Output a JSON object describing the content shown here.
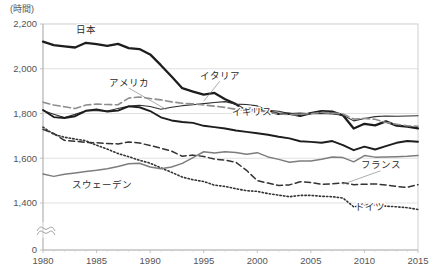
{
  "chart_data": {
    "type": "line",
    "title": "",
    "subtitle": "",
    "unit_label": "(時間)",
    "xlabel": "",
    "ylabel": "",
    "xlim": [
      1980,
      2015
    ],
    "ylim": [
      1300,
      2200
    ],
    "ytick_values": [
      2200,
      2000,
      1800,
      1600,
      1400,
      0
    ],
    "ytick_labels": [
      "2,200",
      "2,000",
      "1,800",
      "1,600",
      "1,400",
      "0"
    ],
    "xtick_values": [
      1980,
      1985,
      1990,
      1995,
      2000,
      2005,
      2010,
      2015
    ],
    "xtick_labels": [
      "1980",
      "1985",
      "1990",
      "1995",
      "2000",
      "2005",
      "2010",
      "2015"
    ],
    "grid": true,
    "grid_axis": "y",
    "axis_break": true,
    "legend_position": "inline-annotations",
    "x": [
      1980,
      1981,
      1982,
      1983,
      1984,
      1985,
      1986,
      1987,
      1988,
      1989,
      1990,
      1991,
      1992,
      1993,
      1994,
      1995,
      1996,
      1997,
      1998,
      1999,
      2000,
      2001,
      2002,
      2003,
      2004,
      2005,
      2006,
      2007,
      2008,
      2009,
      2010,
      2011,
      2012,
      2013,
      2014,
      2015
    ],
    "series": [
      {
        "name": "日本",
        "label": "日本",
        "label_en": "Japan",
        "style": "solid-thick",
        "color": "#1d1d1d",
        "width": 2.3,
        "label_x": 1984.0,
        "label_y": 2158,
        "leader": false,
        "values": [
          2121,
          2106,
          2100,
          2095,
          2116,
          2110,
          2102,
          2111,
          2092,
          2088,
          2064,
          2016,
          1965,
          1913,
          1898,
          1884,
          1892,
          1864,
          1842,
          1810,
          1821,
          1809,
          1798,
          1799,
          1789,
          1802,
          1811,
          1808,
          1792,
          1733,
          1754,
          1747,
          1765,
          1746,
          1741,
          1734
        ]
      },
      {
        "name": "アメリカ",
        "label": "アメリカ",
        "label_en": "United States",
        "style": "solid-thin",
        "color": "#2e2e2e",
        "width": 1.1,
        "label_x": 1988.0,
        "label_y": 1925,
        "leader": true,
        "leader_to_x": 1991.5,
        "leader_to_y": 1818,
        "values": [
          1813,
          1797,
          1782,
          1796,
          1812,
          1812,
          1811,
          1822,
          1833,
          1837,
          1831,
          1819,
          1828,
          1835,
          1839,
          1844,
          1849,
          1853,
          1842,
          1840,
          1834,
          1814,
          1810,
          1800,
          1802,
          1799,
          1800,
          1798,
          1792,
          1767,
          1778,
          1786,
          1789,
          1788,
          1789,
          1790
        ]
      },
      {
        "name": "イタリア",
        "label": "イタリア",
        "label_en": "Italy",
        "style": "dashed-gray",
        "color": "#8d8d8d",
        "width": 1.6,
        "label_x": 1996.5,
        "label_y": 1955,
        "leader": true,
        "leader_to_x": 1995.0,
        "leader_to_y": 1855,
        "values": [
          1850,
          1838,
          1830,
          1822,
          1838,
          1842,
          1840,
          1839,
          1869,
          1874,
          1867,
          1861,
          1852,
          1846,
          1843,
          1838,
          1833,
          1827,
          1819,
          1812,
          1814,
          1806,
          1798,
          1795,
          1795,
          1800,
          1805,
          1802,
          1798,
          1775,
          1778,
          1774,
          1760,
          1752,
          1745,
          1743
        ]
      },
      {
        "name": "イギリス",
        "label": "イギリス",
        "label_en": "United Kingdom",
        "style": "solid-thick",
        "color": "#1d1d1d",
        "width": 1.9,
        "label_x": 1999.5,
        "label_y": 1795,
        "leader": false,
        "values": [
          1816,
          1784,
          1780,
          1788,
          1812,
          1818,
          1809,
          1813,
          1832,
          1828,
          1811,
          1783,
          1769,
          1762,
          1758,
          1745,
          1739,
          1733,
          1724,
          1718,
          1712,
          1705,
          1696,
          1689,
          1676,
          1673,
          1669,
          1677,
          1659,
          1636,
          1652,
          1639,
          1654,
          1669,
          1677,
          1674
        ]
      },
      {
        "name": "フランス",
        "label": "フランス",
        "label_en": "France",
        "style": "dashed-dark",
        "color": "#333333",
        "width": 1.5,
        "label_x": 2011.5,
        "label_y": 1555,
        "leader": true,
        "leader_to_x": 2008.0,
        "leader_to_y": 1484,
        "values": [
          1729,
          1711,
          1680,
          1676,
          1671,
          1669,
          1666,
          1664,
          1673,
          1668,
          1657,
          1645,
          1632,
          1609,
          1614,
          1608,
          1596,
          1592,
          1582,
          1546,
          1500,
          1489,
          1478,
          1481,
          1495,
          1492,
          1483,
          1486,
          1490,
          1482,
          1484,
          1485,
          1481,
          1474,
          1470,
          1482
        ]
      },
      {
        "name": "ドイツ",
        "label": "ドイツ",
        "label_en": "Germany",
        "style": "dotted",
        "color": "#333333",
        "width": 1.6,
        "label_x": 2010.5,
        "label_y": 1368,
        "leader": false,
        "values": [
          1739,
          1707,
          1694,
          1686,
          1678,
          1658,
          1641,
          1621,
          1607,
          1591,
          1578,
          1557,
          1537,
          1516,
          1504,
          1496,
          1480,
          1474,
          1464,
          1455,
          1452,
          1442,
          1435,
          1428,
          1434,
          1434,
          1430,
          1428,
          1422,
          1383,
          1390,
          1393,
          1386,
          1383,
          1379,
          1371
        ]
      },
      {
        "name": "スウェーデン",
        "label": "スウェーデン",
        "label_en": "Sweden",
        "style": "solid-gray",
        "color": "#7d7d7d",
        "width": 1.5,
        "label_x": 1985.5,
        "label_y": 1468,
        "leader": false,
        "values": [
          1530,
          1519,
          1528,
          1534,
          1541,
          1546,
          1553,
          1563,
          1575,
          1578,
          1561,
          1553,
          1561,
          1577,
          1603,
          1629,
          1623,
          1629,
          1626,
          1618,
          1625,
          1606,
          1595,
          1582,
          1588,
          1588,
          1596,
          1606,
          1603,
          1584,
          1612,
          1605,
          1606,
          1607,
          1609,
          1612
        ]
      }
    ]
  },
  "layout": {
    "plot_left": 43,
    "plot_right": 418,
    "plot_top": 24,
    "plot_bottom": 250
  }
}
